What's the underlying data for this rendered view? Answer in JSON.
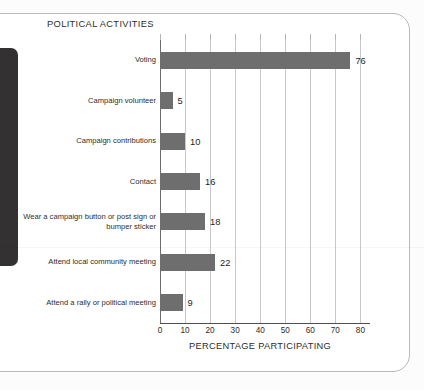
{
  "card": {
    "accent_dark": "#333132",
    "border_color": "#b9b9bb"
  },
  "chart_data": {
    "type": "bar",
    "orientation": "horizontal",
    "title": "POLITICAL ACTIVITIES",
    "xlabel": "PERCENTAGE PARTICIPATING",
    "ylabel": "",
    "categories": [
      "Voting",
      "Campaign volunteer",
      "Campaign contributions",
      "Contact",
      "Wear a campaign button or post sign or bumper sticker",
      "Attend local community meeting",
      "Attend a rally or political meeting"
    ],
    "values": [
      76,
      5,
      10,
      16,
      18,
      22,
      9
    ],
    "value_labels": [
      "76",
      "5",
      "10",
      "16",
      "18",
      "22",
      "9"
    ],
    "xlim": [
      0,
      80
    ],
    "xticks": [
      0,
      10,
      20,
      30,
      40,
      50,
      60,
      70,
      80
    ],
    "xtick_labels": [
      "0",
      "10",
      "20",
      "30",
      "40",
      "50",
      "60",
      "70",
      "80"
    ],
    "grid": "vertical",
    "legend": null,
    "bar_color": "#6e6e6e",
    "gridline_color": "#c8c8cc",
    "axis_color": "#4e4e50"
  }
}
